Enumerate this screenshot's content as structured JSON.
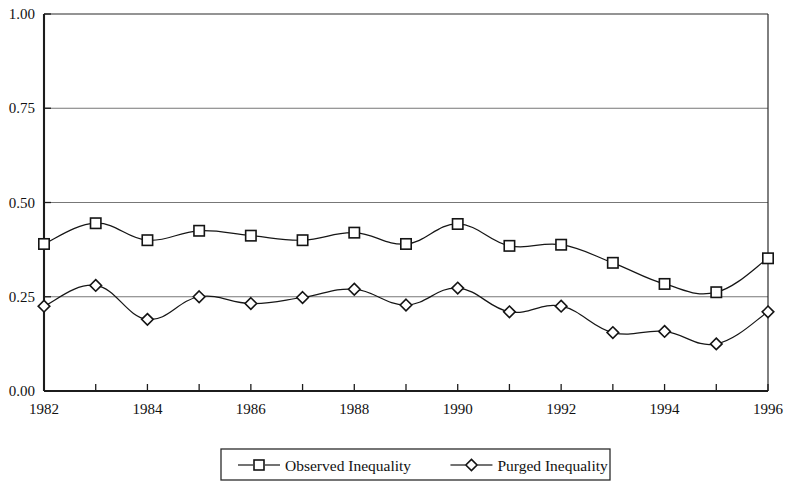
{
  "chart_data": {
    "type": "line",
    "title": "",
    "subtitle": "",
    "xlabel": "",
    "ylabel": "",
    "x": [
      1982,
      1983,
      1984,
      1985,
      1986,
      1987,
      1988,
      1989,
      1990,
      1991,
      1992,
      1993,
      1994,
      1995,
      1996
    ],
    "xlim": [
      1982,
      1996
    ],
    "ylim": [
      0.0,
      1.0
    ],
    "grid": "horizontal",
    "legend_position": "below-plot-center",
    "y_ticks": [
      0.0,
      0.25,
      0.5,
      0.75,
      1.0
    ],
    "y_tick_labels": [
      "0.00",
      "0.25",
      "0.50",
      "0.75",
      "1.00"
    ],
    "x_ticks": [
      1982,
      1983,
      1984,
      1985,
      1986,
      1987,
      1988,
      1989,
      1990,
      1991,
      1992,
      1993,
      1994,
      1995,
      1996
    ],
    "x_tick_labels": [
      "1982",
      "",
      "1984",
      "",
      "1986",
      "",
      "1988",
      "",
      "1990",
      "",
      "1992",
      "",
      "1994",
      "",
      "1996"
    ],
    "x_tick_labels_visible": [
      "1982",
      "1984",
      "1986",
      "1988",
      "1990",
      "1992",
      "1994",
      "1996"
    ],
    "series": [
      {
        "name": "Observed Inequality",
        "marker": "square",
        "color": "#141414",
        "values": [
          0.39,
          0.445,
          0.4,
          0.425,
          0.412,
          0.4,
          0.42,
          0.39,
          0.443,
          0.385,
          0.388,
          0.34,
          0.284,
          0.262,
          0.352
        ]
      },
      {
        "name": "Purged Inequality",
        "marker": "diamond",
        "color": "#141414",
        "values": [
          0.225,
          0.28,
          0.19,
          0.25,
          0.232,
          0.248,
          0.27,
          0.228,
          0.273,
          0.21,
          0.225,
          0.155,
          0.158,
          0.125,
          0.21
        ]
      }
    ]
  },
  "legend": {
    "items": [
      {
        "label": "Observed Inequality",
        "marker": "square"
      },
      {
        "label": "Purged Inequality",
        "marker": "diamond"
      }
    ]
  },
  "axes": {
    "y_labels": [
      "1.00",
      "0.75",
      "0.50",
      "0.25",
      "0.00"
    ],
    "x_labels": [
      "1982",
      "1984",
      "1986",
      "1988",
      "1990",
      "1992",
      "1994",
      "1996"
    ]
  }
}
